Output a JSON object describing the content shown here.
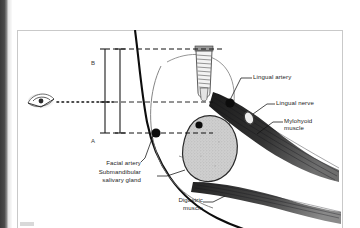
{
  "figure": {
    "type": "anatomical-cross-section",
    "view_marker": "eye-icon with dotted sight line indicating viewing direction"
  },
  "labels": [
    {
      "id": "lingual-artery",
      "text": "Lingual artery",
      "lines": [
        "Lingual artery"
      ]
    },
    {
      "id": "lingual-nerve",
      "text": "Lingual nerve",
      "lines": [
        "Lingual nerve"
      ]
    },
    {
      "id": "mylohyoid-muscle",
      "text": "Mylohyoid muscle",
      "lines": [
        "Mylohyoid",
        "muscle"
      ]
    },
    {
      "id": "facial-artery",
      "text": "Facial artery",
      "lines": [
        "Facial artery"
      ]
    },
    {
      "id": "submandibular-gland",
      "text": "Submandibular salivary gland",
      "lines": [
        "Submandibular",
        "salivary gland"
      ]
    },
    {
      "id": "digastric-muscle",
      "text": "Digastric muscle",
      "lines": [
        "Digastric",
        "muscle"
      ]
    }
  ],
  "measurements": [
    {
      "id": "measure-b",
      "label": "B",
      "position": "upper",
      "description": "distance from implant head level to sight line"
    },
    {
      "id": "measure-a",
      "label": "A",
      "position": "lower",
      "description": "distance from sight line to implant apex level"
    }
  ],
  "structures": {
    "implant": "threaded dental implant",
    "mandible": "mandibular cortical outline",
    "gland": "submandibular salivary gland",
    "mylohyoid": "mylohyoid muscle fibers",
    "digastric": "digastric muscle fibers",
    "vessels": [
      "lingual artery",
      "facial artery"
    ],
    "nerve": "lingual nerve"
  },
  "colors": {
    "ink": "#1c1c1c",
    "frame": "#c9c9c9",
    "gland_fill": "#c9c9c9",
    "muscle_dark": "#2b2b2b",
    "vessel": "#111111",
    "page": "#ffffff"
  }
}
